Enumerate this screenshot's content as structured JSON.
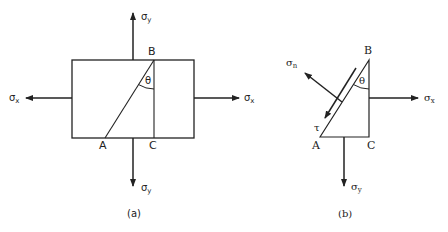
{
  "figure": {
    "panels": [
      {
        "id": "a",
        "caption": "(a)",
        "description": "Rectangular stress element with inclined plane AB at angle theta from vertical BC",
        "points": {
          "A": "A",
          "B": "B",
          "C": "C"
        },
        "angle_label": "θ",
        "stresses": {
          "left": {
            "symbol": "σ",
            "sub": "x"
          },
          "right": {
            "symbol": "σ",
            "sub": "x"
          },
          "top": {
            "symbol": "σ",
            "sub": "y"
          },
          "bottom": {
            "symbol": "σ",
            "sub": "y"
          }
        }
      },
      {
        "id": "b",
        "caption": "(b)",
        "description": "Free-body triangular wedge ABC with normal and shear stress on inclined face AB",
        "points": {
          "A": "A",
          "B": "B",
          "C": "C"
        },
        "angle_label": "θ",
        "stresses": {
          "normal": {
            "symbol": "σ",
            "sub": "n"
          },
          "shear": {
            "symbol": "τ"
          },
          "right": {
            "symbol": "σ",
            "sub": "x"
          },
          "bottom": {
            "symbol": "σ",
            "sub": "y"
          }
        }
      }
    ]
  },
  "colors": {
    "line": "#222222",
    "background": "#ffffff"
  }
}
